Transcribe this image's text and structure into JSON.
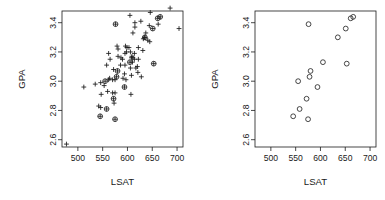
{
  "figure": {
    "background_color": "#ffffff",
    "foreground_color": "#1a1a1a",
    "panel_count": 2
  },
  "chart_data": [
    {
      "panel": "left",
      "type": "scatter",
      "title": "",
      "xlabel": "LSAT",
      "ylabel": "GPA",
      "xlim": [
        468,
        712
      ],
      "ylim": [
        2.55,
        3.48
      ],
      "xticks": [
        500,
        550,
        600,
        650,
        700
      ],
      "yticks": [
        "2.6",
        "2.8",
        "3.0",
        "3.2",
        "3.4"
      ],
      "ytick_values": [
        2.6,
        2.8,
        3.0,
        3.2,
        3.4
      ],
      "grid": false,
      "legend": "none",
      "box": true,
      "series": [
        {
          "name": "population",
          "marker": "plus",
          "color": "#1a1a1a",
          "points": [
            [
              622,
              3.23
            ],
            [
              542,
              2.83
            ],
            [
              579,
              3.24
            ],
            [
              653,
              3.12
            ],
            [
              606,
              3.09
            ],
            [
              576,
              3.39
            ],
            [
              620,
              3.1
            ],
            [
              615,
              3.4
            ],
            [
              553,
              2.97
            ],
            [
              607,
              2.91
            ],
            [
              558,
              3.11
            ],
            [
              596,
              3.24
            ],
            [
              635,
              3.3
            ],
            [
              581,
              3.22
            ],
            [
              661,
              3.43
            ],
            [
              547,
              2.91
            ],
            [
              599,
              3.23
            ],
            [
              646,
              3.47
            ],
            [
              622,
              3.15
            ],
            [
              611,
              3.33
            ],
            [
              546,
              2.99
            ],
            [
              614,
              3.19
            ],
            [
              628,
              3.03
            ],
            [
              575,
              3.01
            ],
            [
              662,
              3.39
            ],
            [
              627,
              3.41
            ],
            [
              608,
              3.04
            ],
            [
              632,
              3.29
            ],
            [
              587,
              3.16
            ],
            [
              581,
              3.17
            ],
            [
              605,
              3.13
            ],
            [
              704,
              3.36
            ],
            [
              477,
              2.57
            ],
            [
              591,
              3.02
            ],
            [
              578,
              3.03
            ],
            [
              572,
              2.88
            ],
            [
              615,
              3.37
            ],
            [
              606,
              3.2
            ],
            [
              603,
              3.23
            ],
            [
              535,
              2.98
            ],
            [
              595,
              3.11
            ],
            [
              575,
              2.92
            ],
            [
              573,
              2.85
            ],
            [
              644,
              3.38
            ],
            [
              545,
              2.76
            ],
            [
              645,
              3.27
            ],
            [
              651,
              3.36
            ],
            [
              562,
              3.19
            ],
            [
              609,
              3.17
            ],
            [
              555,
              3.0
            ],
            [
              586,
              3.11
            ],
            [
              580,
              3.07
            ],
            [
              594,
              2.96
            ],
            [
              594,
              3.05
            ],
            [
              560,
              2.93
            ],
            [
              641,
              3.28
            ],
            [
              512,
              2.96
            ],
            [
              631,
              3.21
            ],
            [
              597,
              3.01
            ],
            [
              621,
              3.06
            ],
            [
              617,
              3.09
            ],
            [
              637,
              3.33
            ],
            [
              572,
              3.08
            ],
            [
              610,
              3.13
            ],
            [
              562,
              3.01
            ],
            [
              635,
              3.3
            ],
            [
              614,
              3.15
            ],
            [
              546,
              2.82
            ],
            [
              598,
              3.2
            ],
            [
              666,
              3.44
            ],
            [
              570,
              3.01
            ],
            [
              570,
              2.92
            ],
            [
              605,
              3.45
            ],
            [
              565,
              3.15
            ],
            [
              686,
              3.5
            ],
            [
              608,
              3.16
            ],
            [
              595,
              3.19
            ],
            [
              590,
              3.15
            ],
            [
              558,
              2.81
            ],
            [
              611,
              3.16
            ],
            [
              564,
              3.02
            ],
            [
              575,
              2.74
            ]
          ]
        },
        {
          "name": "sample",
          "marker": "circle",
          "color": "#1a1a1a",
          "points": [
            [
              576,
              3.39
            ],
            [
              635,
              3.3
            ],
            [
              558,
              2.81
            ],
            [
              578,
              3.03
            ],
            [
              666,
              3.44
            ],
            [
              580,
              3.07
            ],
            [
              555,
              3.0
            ],
            [
              661,
              3.43
            ],
            [
              651,
              3.36
            ],
            [
              605,
              3.13
            ],
            [
              653,
              3.12
            ],
            [
              575,
              2.74
            ],
            [
              545,
              2.76
            ],
            [
              572,
              2.88
            ],
            [
              594,
              2.96
            ]
          ]
        }
      ]
    },
    {
      "panel": "right",
      "type": "scatter",
      "title": "",
      "xlabel": "LSAT",
      "ylabel": "GPA",
      "xlim": [
        468,
        712
      ],
      "ylim": [
        2.55,
        3.48
      ],
      "xticks": [
        500,
        550,
        600,
        650,
        700
      ],
      "yticks": [
        "2.6",
        "2.8",
        "3.0",
        "3.2",
        "3.4"
      ],
      "ytick_values": [
        2.6,
        2.8,
        3.0,
        3.2,
        3.4
      ],
      "grid": false,
      "legend": "none",
      "box": true,
      "series": [
        {
          "name": "sample",
          "marker": "circle",
          "color": "#1a1a1a",
          "points": [
            [
              576,
              3.39
            ],
            [
              635,
              3.3
            ],
            [
              558,
              2.81
            ],
            [
              578,
              3.03
            ],
            [
              666,
              3.44
            ],
            [
              580,
              3.07
            ],
            [
              555,
              3.0
            ],
            [
              661,
              3.43
            ],
            [
              651,
              3.36
            ],
            [
              605,
              3.13
            ],
            [
              653,
              3.12
            ],
            [
              575,
              2.74
            ],
            [
              545,
              2.76
            ],
            [
              572,
              2.88
            ],
            [
              594,
              2.96
            ]
          ]
        }
      ]
    }
  ]
}
